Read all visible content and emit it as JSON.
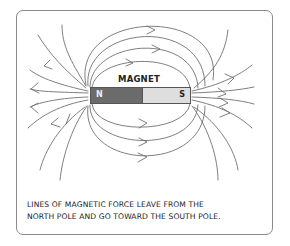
{
  "diagram": {
    "magnet_label": "MAGNET",
    "north_pole_label": "N",
    "south_pole_label": "S",
    "caption_line1": "LINES OF MAGNETIC FORCE LEAVE FROM THE",
    "caption_line2": "NORTH POLE AND GO TOWARD THE SOUTH POLE.",
    "colors": {
      "north_pole": "#6b6b6b",
      "south_pole": "#dedede",
      "field_lines": "#707070",
      "frame_border": "#8a8a8a"
    }
  }
}
